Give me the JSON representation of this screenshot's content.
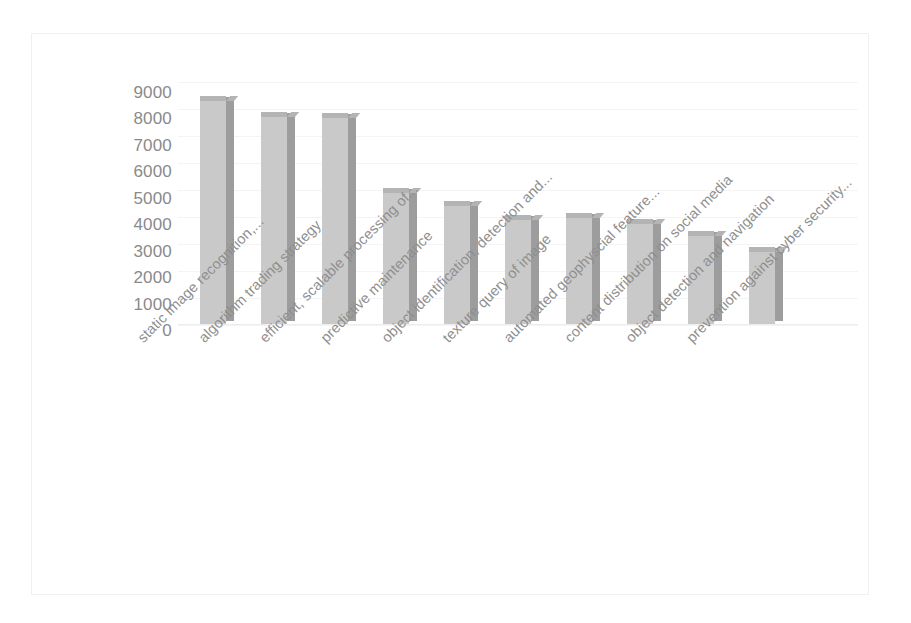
{
  "chart_data": {
    "type": "bar",
    "title": "",
    "subtitle": "",
    "xlabel": "",
    "ylabel": "",
    "grid": true,
    "legend": false,
    "legend_position": "none",
    "ylim": [
      0,
      9000
    ],
    "ytick_labels": [
      "9000",
      "8000",
      "7000",
      "6000",
      "5000",
      "4000",
      "3000",
      "2000",
      "1000",
      "0"
    ],
    "ytick_values": [
      9000,
      8000,
      7000,
      6000,
      5000,
      4000,
      3000,
      2000,
      1000,
      0
    ],
    "categories": [
      "static image recognition,...",
      "algorithm trading strategy",
      "efficient, scalable processing of...",
      "predictive maintenance",
      "object identification, detection and...",
      "texture query of image",
      "automated geophyscial feature...",
      "content distribution on social media",
      "object detection and navigation",
      "prevention against cyber security..."
    ],
    "values": [
      8300,
      7700,
      7650,
      4900,
      4400,
      3900,
      3950,
      3750,
      3300,
      2700
    ],
    "bar_colors": {
      "front": "#c9c9c9",
      "side": "#9d9d9d",
      "top": "#b4b4b4"
    },
    "axis_label_color": "#8a8a8a",
    "gridline_color": "#f4f4f4",
    "background": "#ffffff",
    "label_rotation_deg": -45
  }
}
